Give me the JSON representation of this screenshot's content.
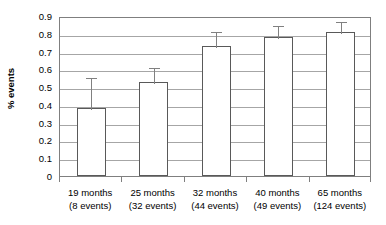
{
  "chart_data": {
    "type": "bar",
    "title": "",
    "xlabel": "",
    "ylabel": "% events",
    "ylim": [
      0,
      0.9
    ],
    "ytick_values": [
      0,
      0.1,
      0.2,
      0.3,
      0.4,
      0.5,
      0.6,
      0.7,
      0.8,
      0.9
    ],
    "ytick_labels": [
      "0",
      "0.1",
      "0.2",
      "0.3",
      "0.4",
      "0.5",
      "0.6",
      "0.7",
      "0.8",
      "0.9"
    ],
    "grid": true,
    "legend": null,
    "categories": [
      "19 months\n(8 events)",
      "25 months\n(32 events)",
      "32 months\n(44 events)",
      "40 months\n(49 events)",
      "65 months\n(124 events)"
    ],
    "category_lines": [
      {
        "line1": "19 months",
        "line2": "(8 events)"
      },
      {
        "line1": "25 months",
        "line2": "(32 events)"
      },
      {
        "line1": "32 months",
        "line2": "(44 events)"
      },
      {
        "line1": "40 months",
        "line2": "(49 events)"
      },
      {
        "line1": "65 months",
        "line2": "(124 events)"
      }
    ],
    "values": [
      0.38,
      0.53,
      0.73,
      0.78,
      0.81
    ],
    "error_upper": [
      0.56,
      0.62,
      0.82,
      0.855,
      0.875
    ],
    "error_bars": [
      {
        "value": 0.38,
        "upper": 0.56
      },
      {
        "value": 0.53,
        "upper": 0.62
      },
      {
        "value": 0.73,
        "upper": 0.82
      },
      {
        "value": 0.78,
        "upper": 0.855
      },
      {
        "value": 0.81,
        "upper": 0.875
      }
    ],
    "colors": {
      "bar_fill": "#ffffff",
      "bar_edge": "#595959",
      "gridline": "#a6a6a6",
      "axis": "#7f7f7f",
      "error": "#808080",
      "text": "#000000",
      "background": "#ffffff"
    }
  }
}
